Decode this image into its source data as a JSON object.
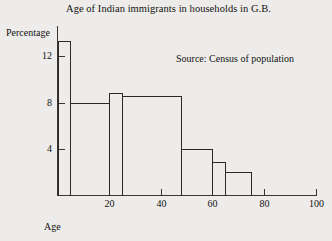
{
  "chart_data": {
    "type": "bar",
    "title": "Age of Indian immigrants in households in G.B.",
    "xlabel": "Age",
    "ylabel": "Percentage",
    "annotation": "Source: Census of population",
    "xlim": [
      0,
      100
    ],
    "ylim": [
      0,
      14
    ],
    "xticks": [
      20,
      40,
      60,
      80,
      100
    ],
    "xtick_labels": [
      "20",
      "40",
      "60",
      "80",
      "100"
    ],
    "yticks": [
      4,
      8,
      12
    ],
    "ytick_labels": [
      "4",
      "8",
      "12"
    ],
    "grid": false,
    "legend": false,
    "bins": [
      {
        "label": "0-5",
        "x0": 0,
        "x1": 5,
        "value": 13.3
      },
      {
        "label": "5-20",
        "x0": 5,
        "x1": 20,
        "value": 8.0
      },
      {
        "label": "20-25",
        "x0": 20,
        "x1": 25,
        "value": 8.8
      },
      {
        "label": "25-48",
        "x0": 25,
        "x1": 48,
        "value": 8.6
      },
      {
        "label": "48-60",
        "x0": 48,
        "x1": 60,
        "value": 4.0
      },
      {
        "label": "60-65",
        "x0": 60,
        "x1": 65,
        "value": 2.9
      },
      {
        "label": "65-75",
        "x0": 65,
        "x1": 75,
        "value": 2.0
      }
    ],
    "categories": [
      "0-5",
      "5-20",
      "20-25",
      "25-48",
      "48-60",
      "60-65",
      "65-75"
    ],
    "values": [
      13.3,
      8.0,
      8.8,
      8.6,
      4.0,
      2.9,
      2.0
    ]
  },
  "style": {
    "background": "#edecea",
    "ink": "#2b2826",
    "axis": "#3a3733"
  }
}
